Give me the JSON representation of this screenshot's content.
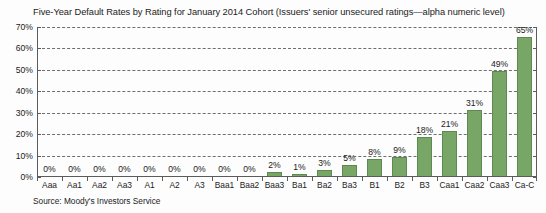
{
  "chart_data": {
    "type": "bar",
    "title": "Five-Year Default Rates by Rating for January 2014 Cohort (Issuers' senior unsecured ratings—alpha numeric level)",
    "xlabel": "",
    "ylabel": "",
    "ylim": [
      0,
      70
    ],
    "grid": true,
    "legend": null,
    "source": "Source: Moody's Investors Service",
    "bar_color": "#77a667",
    "bar_border_color": "#5e8a51",
    "gridline_color": "#6e6e6e",
    "axis_color": "#5b5b5b",
    "yticks": [
      0,
      10,
      20,
      30,
      40,
      50,
      60,
      70
    ],
    "ytick_labels": [
      "0%",
      "10%",
      "20%",
      "30%",
      "40%",
      "50%",
      "60%",
      "70%"
    ],
    "categories": [
      "Aaa",
      "Aa1",
      "Aa2",
      "Aa3",
      "A1",
      "A2",
      "A3",
      "Baa1",
      "Baa2",
      "Baa3",
      "Ba1",
      "Ba2",
      "Ba3",
      "B1",
      "B2",
      "B3",
      "Caa1",
      "Caa2",
      "Caa3",
      "Ca-C"
    ],
    "values": [
      0,
      0,
      0,
      0,
      0,
      0,
      0,
      0,
      0,
      2,
      1,
      3,
      5,
      8,
      9,
      18,
      21,
      31,
      49,
      65
    ],
    "data_labels": [
      "0%",
      "0%",
      "0%",
      "0%",
      "0%",
      "0%",
      "0%",
      "0%",
      "0%",
      "2%",
      "1%",
      "3%",
      "5%",
      "8%",
      "9%",
      "18%",
      "21%",
      "31%",
      "49%",
      "65%"
    ]
  }
}
